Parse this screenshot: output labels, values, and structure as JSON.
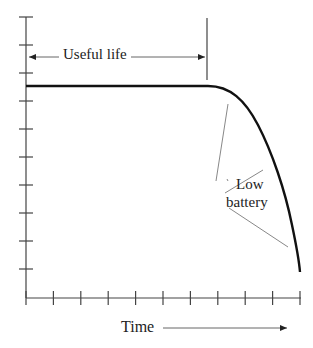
{
  "chart_data": {
    "type": "line",
    "title": "",
    "xlabel": "Time",
    "ylabel": "",
    "grid": false,
    "x_tick_count": 11,
    "y_tick_count": 10,
    "tick_labels": {
      "x": [],
      "y": []
    },
    "series": [
      {
        "name": "Battery voltage",
        "description": "Flat (constant) output during useful life, then sharp fall-off at end of life",
        "x": [
          0,
          1,
          2,
          3,
          4,
          5,
          6,
          6.9,
          7.5,
          8,
          8.5,
          9,
          9.5,
          10
        ],
        "y": [
          7.5,
          7.5,
          7.5,
          7.5,
          7.5,
          7.5,
          7.5,
          7.5,
          7.2,
          6.6,
          5.8,
          4.6,
          3.0,
          0.9
        ]
      }
    ],
    "annotations": [
      {
        "text": "Useful life",
        "type": "double-arrow span",
        "x_from": 0,
        "x_to": 6.6
      },
      {
        "text": "Low battery",
        "type": "callout",
        "points_to_x": [
          7.8,
          9.0,
          9.9
        ]
      },
      {
        "text": "Time",
        "type": "axis-arrow"
      }
    ]
  },
  "labels": {
    "useful_life": "Useful life",
    "low": "Low",
    "battery": "battery",
    "time": "Time"
  },
  "colors": {
    "axis": "#444444",
    "curve": "#111111",
    "callout": "#888888",
    "text": "#222222"
  }
}
